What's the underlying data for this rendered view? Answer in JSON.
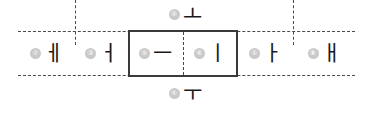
{
  "diagram": {
    "grid": {
      "left": 18,
      "right": 355,
      "top": 31,
      "bottom": 76
    },
    "colors": {
      "dashed_line": "#4a4a4a",
      "solid_box": "#3a3a3a",
      "marker_bg": "#c9c9c9",
      "marker_text": "#ffffff",
      "glyph": "#1a1a1a",
      "background": "#ffffff"
    },
    "highlight_box": {
      "label": "selected-cells",
      "cells": [
        "eu",
        "i"
      ]
    },
    "cells": [
      {
        "key": "e",
        "marker": "⑦",
        "number": "7",
        "glyph": "ㅔ",
        "left": 18,
        "width": 57,
        "position": "row",
        "boxed": false
      },
      {
        "key": "eo",
        "marker": "③",
        "number": "3",
        "glyph": "ㅓ",
        "left": 75,
        "width": 53,
        "position": "row",
        "boxed": false
      },
      {
        "key": "eu",
        "marker": "⑤",
        "number": "5",
        "glyph": "ㅡ",
        "left": 128,
        "width": 55,
        "position": "row",
        "boxed": true
      },
      {
        "key": "i",
        "marker": "⑥",
        "number": "6",
        "glyph": "ㅣ",
        "left": 183,
        "width": 55,
        "position": "row",
        "boxed": true
      },
      {
        "key": "a",
        "marker": "①",
        "number": "1",
        "glyph": "ㅏ",
        "left": 238,
        "width": 55,
        "position": "row",
        "boxed": false
      },
      {
        "key": "ae",
        "marker": "⑧",
        "number": "8",
        "glyph": "ㅐ",
        "left": 293,
        "width": 62,
        "position": "row",
        "boxed": false
      },
      {
        "key": "o",
        "marker": "②",
        "number": "2",
        "glyph": "ㅗ",
        "left": 155,
        "width": 60,
        "position": "above",
        "boxed": false
      },
      {
        "key": "u",
        "marker": "④",
        "number": "4",
        "glyph": "ㅜ",
        "left": 155,
        "width": 60,
        "position": "below",
        "boxed": false
      }
    ],
    "dividers": [
      {
        "key": "divider-1",
        "left": 75,
        "style": "dashed"
      },
      {
        "key": "divider-2",
        "left": 128,
        "style": "solid-box-edge"
      },
      {
        "key": "divider-3",
        "left": 183,
        "style": "dashed"
      },
      {
        "key": "divider-4",
        "left": 238,
        "style": "solid-box-edge"
      },
      {
        "key": "divider-5",
        "left": 293,
        "style": "dashed"
      }
    ]
  }
}
